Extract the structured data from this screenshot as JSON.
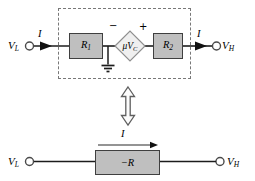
{
  "diagram_type": "circuit-equivalence",
  "colors": {
    "resistor_fill": "#bfbfbf",
    "resistor_border": "#3f3f3f",
    "source_fill": "#efefef",
    "source_border": "#8f8f8f",
    "wire": "#1c1c1c",
    "dashed_border": "#787878",
    "arrow_fill": "#111111",
    "equiv_arrow_fill": "#fcfcfc",
    "equiv_arrow_stroke": "#5f5f5f"
  },
  "top_circuit": {
    "input_label": {
      "base": "V",
      "sub": "L"
    },
    "input_current_label": "I",
    "r1": {
      "base": "R",
      "sub": "1"
    },
    "dependent_source": {
      "minus": "−",
      "plus": "+",
      "base": "μV",
      "sub": "C"
    },
    "r2": {
      "base": "R",
      "sub": "2"
    },
    "output_current_label": "I",
    "output_label": {
      "base": "V",
      "sub": "H"
    }
  },
  "equivalence": {
    "symbol_name": "double-headed-vertical-arrow"
  },
  "bottom_circuit": {
    "input_label": {
      "base": "V",
      "sub": "L"
    },
    "current_label": "I",
    "resistor_label": "−R",
    "output_label": {
      "base": "V",
      "sub": "H"
    }
  }
}
